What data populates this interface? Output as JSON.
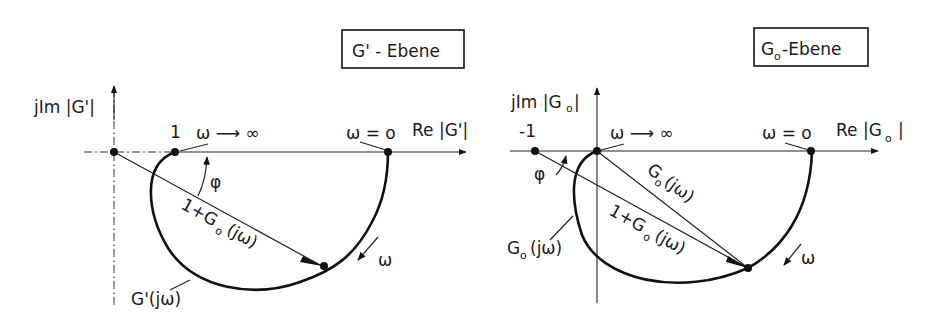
{
  "left_panel": {
    "plane_title": "G' - Ebene",
    "y_axis_label": "jIm |G'|",
    "x_axis_label": "Re |G'|",
    "point_one_label": "1",
    "omega_inf_label": "ω ⟶ ∞",
    "omega_zero_label": "ω = o",
    "phi_label": "φ",
    "vector_label_prefix": "1+G",
    "vector_label_sub": "o",
    "vector_label_suffix": "(jω)",
    "curve_label": "G'(jω)",
    "omega_dir_label": "ω"
  },
  "right_panel": {
    "plane_title_main": "G",
    "plane_title_sub": "o",
    "plane_title_rest": "-Ebene",
    "y_axis_label_main": "jIm |G",
    "y_axis_label_sub": "o",
    "y_axis_label_end": "|",
    "x_axis_label_main": "Re |G",
    "x_axis_label_sub": "o",
    "x_axis_label_end": "|",
    "point_minus_one_label": "-1",
    "omega_inf_label": "ω ⟶ ∞",
    "omega_zero_label": "ω = o",
    "phi_label": "φ",
    "vector1_label_main": "G",
    "vector1_label_sub": "o",
    "vector1_label_end": "(jω)",
    "vector2_label_prefix": "1+G",
    "vector2_label_sub": "o",
    "vector2_label_suffix": "(jω)",
    "curve_label_main": "G",
    "curve_label_sub": "o",
    "curve_label_end": "(jω)",
    "omega_dir_label": "ω"
  }
}
